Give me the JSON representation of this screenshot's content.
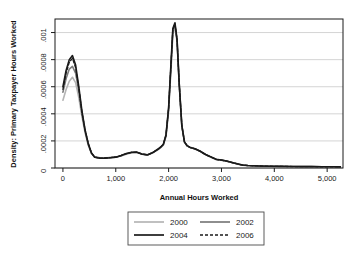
{
  "chart_data": {
    "type": "line",
    "title": "",
    "xlabel": "Annual Hours Worked",
    "ylabel": "Density: Primary Taxpayer Hours Worked",
    "xlim": [
      -150,
      5300
    ],
    "ylim": [
      0,
      0.0011
    ],
    "grid": "horizontal",
    "legend_position": "bottom-center",
    "xticks": [
      0,
      1000,
      2000,
      3000,
      4000,
      5000
    ],
    "xticklabels": [
      "0",
      "1,000",
      "2,000",
      "3,000",
      "4,000",
      "5,000"
    ],
    "yticks": [
      0,
      0.0002,
      0.0004,
      0.0006,
      0.0008,
      0.001
    ],
    "yticklabels": [
      "0",
      ".0002",
      ".0004",
      ".0006",
      ".0008",
      ".001"
    ],
    "x": [
      0,
      60,
      120,
      180,
      240,
      300,
      360,
      420,
      480,
      540,
      600,
      700,
      800,
      900,
      1000,
      1100,
      1200,
      1300,
      1400,
      1500,
      1600,
      1700,
      1800,
      1850,
      1900,
      1950,
      2000,
      2050,
      2080,
      2120,
      2160,
      2200,
      2250,
      2300,
      2350,
      2400,
      2500,
      2600,
      2700,
      2800,
      2900,
      3000,
      3100,
      3200,
      3300,
      3400,
      3500,
      3700,
      3900,
      4100,
      4300,
      4500,
      4700,
      4900,
      5100,
      5250
    ],
    "series": [
      {
        "name": "2000",
        "color": "#b5b5b5",
        "style": "solid",
        "width": 1.6,
        "values": [
          0.0005,
          0.00058,
          0.00064,
          0.00067,
          0.00063,
          0.00052,
          0.00038,
          0.00026,
          0.00017,
          0.00011,
          8.5e-05,
          7.5e-05,
          7.5e-05,
          7.8e-05,
          8e-05,
          8.8e-05,
          0.000102,
          0.000112,
          0.000115,
          0.000104,
          9.8e-05,
          0.000112,
          0.000135,
          0.00015,
          0.000168,
          0.00023,
          0.00042,
          0.00076,
          0.000985,
          0.001045,
          0.00093,
          0.00062,
          0.00031,
          0.00019,
          0.000163,
          0.000152,
          0.00014,
          0.000122,
          9.8e-05,
          8e-05,
          6.2e-05,
          5.8e-05,
          5e-05,
          4e-05,
          3e-05,
          2.1e-05,
          1.8e-05,
          1.5e-05,
          1.3e-05,
          1.2e-05,
          1.1e-05,
          1e-05,
          1e-05,
          9e-06,
          9e-06,
          8e-06
        ]
      },
      {
        "name": "2002",
        "color": "#7a7a7a",
        "style": "solid",
        "width": 1.6,
        "values": [
          0.00056,
          0.00066,
          0.00073,
          0.00075,
          0.0007,
          0.00057,
          0.0004,
          0.00027,
          0.00017,
          0.00011,
          8.2e-05,
          7.3e-05,
          7.4e-05,
          7.7e-05,
          8e-05,
          9e-05,
          0.000105,
          0.000114,
          0.000116,
          0.000103,
          9.7e-05,
          0.000113,
          0.000138,
          0.000153,
          0.000172,
          0.000238,
          0.000435,
          0.00079,
          0.00101,
          0.00106,
          0.00094,
          0.000625,
          0.000312,
          0.000192,
          0.000164,
          0.000153,
          0.000141,
          0.000123,
          9.9e-05,
          8.1e-05,
          6.3e-05,
          5.8e-05,
          5e-05,
          4e-05,
          3e-05,
          2.1e-05,
          1.8e-05,
          1.5e-05,
          1.3e-05,
          1.2e-05,
          1.1e-05,
          1e-05,
          1e-05,
          9e-06,
          9e-06,
          8e-06
        ]
      },
      {
        "name": "2004",
        "color": "#1a1a1a",
        "style": "solid",
        "width": 1.6,
        "values": [
          0.0006,
          0.00072,
          0.0008,
          0.00083,
          0.00076,
          0.0006,
          0.00042,
          0.00028,
          0.00018,
          0.00011,
          8e-05,
          7.2e-05,
          7.3e-05,
          7.6e-05,
          8e-05,
          9.2e-05,
          0.000107,
          0.000116,
          0.000117,
          0.000102,
          9.6e-05,
          0.000114,
          0.00014,
          0.000155,
          0.000175,
          0.000243,
          0.000445,
          0.00081,
          0.00103,
          0.001072,
          0.000948,
          0.000628,
          0.000314,
          0.000193,
          0.000165,
          0.000154,
          0.000142,
          0.000124,
          0.0001,
          8.2e-05,
          6.4e-05,
          5.9e-05,
          5.1e-05,
          4.1e-05,
          3.1e-05,
          2.2e-05,
          1.8e-05,
          1.5e-05,
          1.3e-05,
          1.2e-05,
          1.1e-05,
          1e-05,
          1e-05,
          9e-06,
          9e-06,
          8e-06
        ]
      },
      {
        "name": "2006",
        "color": "#1a1a1a",
        "style": "dashed",
        "width": 1.3,
        "values": [
          0.00058,
          0.0007,
          0.00078,
          0.00081,
          0.00074,
          0.00059,
          0.00041,
          0.00028,
          0.00018,
          0.00011,
          8.1e-05,
          7.3e-05,
          7.4e-05,
          7.7e-05,
          8.1e-05,
          9.1e-05,
          0.000106,
          0.000115,
          0.000116,
          0.000103,
          9.7e-05,
          0.000113,
          0.000139,
          0.000154,
          0.000174,
          0.000241,
          0.00044,
          0.0008,
          0.00102,
          0.001065,
          0.000944,
          0.000626,
          0.000313,
          0.000192,
          0.000164,
          0.000153,
          0.000141,
          0.000123,
          9.9e-05,
          8.1e-05,
          6.3e-05,
          5.8e-05,
          5e-05,
          4e-05,
          3e-05,
          2.1e-05,
          1.8e-05,
          1.5e-05,
          1.3e-05,
          1.2e-05,
          1.1e-05,
          1e-05,
          1e-05,
          9e-06,
          9e-06,
          8e-06
        ]
      }
    ],
    "legend": [
      {
        "label": "2000",
        "color": "#b5b5b5",
        "style": "solid"
      },
      {
        "label": "2002",
        "color": "#7a7a7a",
        "style": "solid"
      },
      {
        "label": "2004",
        "color": "#1a1a1a",
        "style": "solid"
      },
      {
        "label": "2006",
        "color": "#1a1a1a",
        "style": "dashed"
      }
    ]
  }
}
